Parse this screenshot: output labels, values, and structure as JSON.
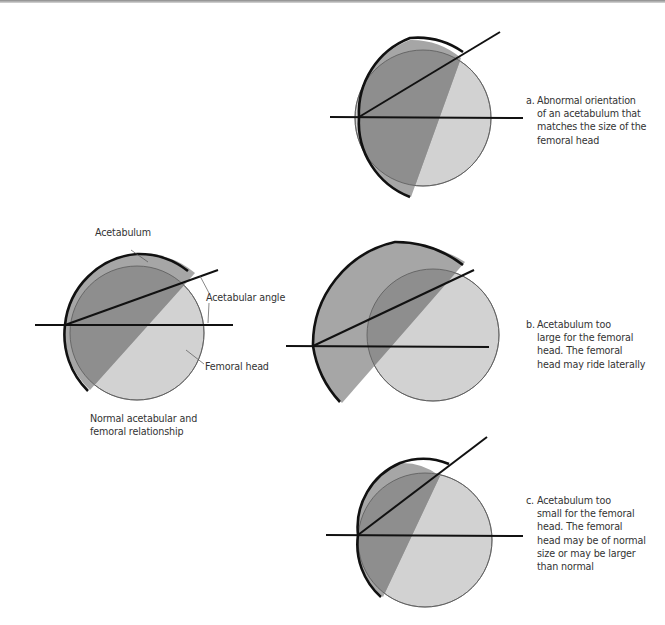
{
  "colors": {
    "femoral_head": "#d2d2d2",
    "acetabulum": "#a6a6a6",
    "overlap": "#8e8e8e",
    "line": "#111111",
    "leader": "#555555",
    "text": "#333333"
  },
  "normal": {
    "labels": {
      "acetabulum": "Acetabulum",
      "acetabular_angle": "Acetabular angle",
      "femoral_head": "Femoral head"
    },
    "caption": "Normal acetabular and\nfemoral relationship"
  },
  "panels": [
    {
      "id": "a",
      "marker": "a.",
      "caption": "Abnormal orientation\nof an acetabulum that\nmatches the size of the\nfemoral head"
    },
    {
      "id": "b",
      "marker": "b.",
      "caption": "Acetabulum too\nlarge for the femoral\nhead. The femoral\nhead may ride laterally"
    },
    {
      "id": "c",
      "marker": "c.",
      "caption": "Acetabulum too\nsmall for the femoral\nhead. The femoral\nhead may be of normal\nsize or may be larger\nthan normal"
    }
  ]
}
